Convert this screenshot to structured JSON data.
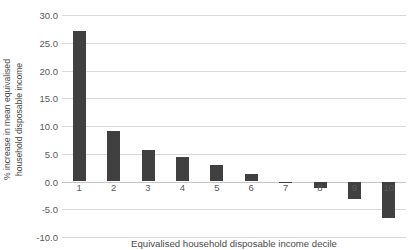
{
  "chart_data": {
    "type": "bar",
    "title": "",
    "xlabel": "Equivalised household disposable income decile",
    "ylabel": "% increase in mean equivalised household disposable income",
    "ylabel_line1": "% increase in mean equivalised",
    "ylabel_line2": "household disposable income",
    "categories": [
      "1",
      "2",
      "3",
      "4",
      "5",
      "6",
      "7",
      "8",
      "9",
      "10"
    ],
    "values": [
      27.1,
      9.1,
      5.7,
      4.4,
      2.9,
      1.4,
      -0.2,
      -1.2,
      -3.2,
      -6.5
    ],
    "ylim": [
      -10.0,
      30.0
    ],
    "ytick_labels": [
      "30.0",
      "25.0",
      "20.0",
      "15.0",
      "10.0",
      "5.0",
      "0.0",
      "-5.0",
      "-10.0"
    ],
    "ytick_values": [
      30.0,
      25.0,
      20.0,
      15.0,
      10.0,
      5.0,
      0.0,
      -5.0,
      -10.0
    ],
    "grid": true,
    "legend": "none",
    "series_color": "#404040",
    "gridline_color": "#d9d9d9",
    "axis_text_color": "#595959"
  }
}
